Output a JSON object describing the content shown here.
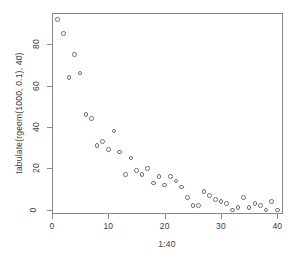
{
  "chart_data": {
    "type": "scatter",
    "title": "",
    "xlabel": "1:40",
    "ylabel": "tabulate(rgeom(1000, 0.1), 40)",
    "xlim": [
      0,
      41
    ],
    "ylim": [
      -2,
      95
    ],
    "grid": false,
    "legend": null,
    "marker": "open-circle",
    "xticks": [
      0,
      10,
      20,
      30,
      40
    ],
    "xticklabels": [
      "0",
      "10",
      "20",
      "30",
      "40"
    ],
    "yticks": [
      0,
      20,
      40,
      60,
      80
    ],
    "yticklabels": [
      "0",
      "20",
      "40",
      "60",
      "80"
    ],
    "x": [
      1,
      2,
      3,
      4,
      5,
      6,
      7,
      8,
      9,
      10,
      11,
      12,
      13,
      14,
      15,
      16,
      17,
      18,
      19,
      20,
      21,
      22,
      23,
      24,
      25,
      26,
      27,
      28,
      29,
      30,
      31,
      32,
      33,
      34,
      35,
      36,
      37,
      38,
      39,
      40
    ],
    "y": [
      92,
      85,
      64,
      75,
      66,
      46,
      44,
      31,
      33,
      29,
      38,
      28,
      17,
      25,
      19,
      17,
      20,
      13,
      16,
      12,
      16,
      14,
      11,
      6,
      2,
      2,
      9,
      7,
      5,
      4,
      3,
      0,
      1,
      6,
      1,
      3,
      2,
      0,
      4,
      0
    ]
  },
  "axes": {
    "x_axis_name": "x-axis",
    "y_axis_name": "y-axis"
  }
}
